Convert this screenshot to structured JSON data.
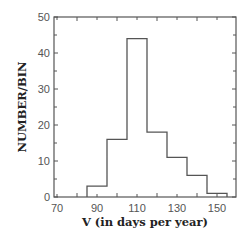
{
  "chart_data": {
    "type": "bar",
    "subtype": "histogram",
    "title": "",
    "xlabel": "V (in days per year)",
    "ylabel": "NUMBER/BIN",
    "xlim": [
      68.5,
      159.5
    ],
    "ylim": [
      0,
      50
    ],
    "x_ticks": [
      70,
      90,
      110,
      130,
      150
    ],
    "y_ticks": [
      0,
      10,
      20,
      30,
      40,
      50
    ],
    "bin_edges": [
      85,
      95,
      105,
      115,
      125,
      135,
      145,
      155
    ],
    "categories": [
      "85-95",
      "95-105",
      "105-115",
      "115-125",
      "125-135",
      "135-145",
      "145-155"
    ],
    "values": [
      3,
      16,
      44,
      18,
      11,
      6,
      1
    ],
    "grid": false,
    "legend": null
  },
  "colors": {
    "line": "#555555",
    "background": "#ffffff",
    "text": "#222222"
  }
}
